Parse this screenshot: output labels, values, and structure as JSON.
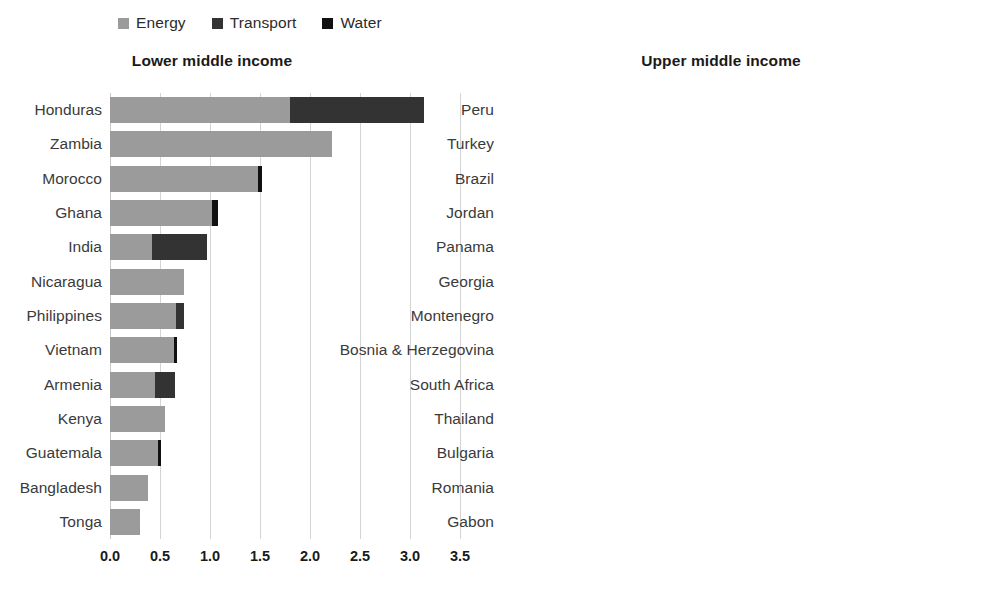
{
  "legend": {
    "items": [
      {
        "label": "Energy",
        "color": "#9b9b9b",
        "name": "energy"
      },
      {
        "label": "Transport",
        "color": "#333333",
        "name": "transport"
      },
      {
        "label": "Water",
        "color": "#111111",
        "name": "water"
      }
    ]
  },
  "chart_data": [
    {
      "type": "bar",
      "orientation": "horizontal",
      "stacked": true,
      "title": "Lower middle income",
      "xlabel": "",
      "ylabel": "",
      "xlim": [
        0.0,
        3.5
      ],
      "xticks": [
        "0.0",
        "0.5",
        "1.0",
        "1.5",
        "2.0",
        "2.5",
        "3.0",
        "3.5"
      ],
      "xtick_values": [
        0.0,
        0.5,
        1.0,
        1.5,
        2.0,
        2.5,
        3.0,
        3.5
      ],
      "grid": true,
      "legend_position": "top-left",
      "categories": [
        "Honduras",
        "Zambia",
        "Morocco",
        "Ghana",
        "India",
        "Nicaragua",
        "Philippines",
        "Vietnam",
        "Armenia",
        "Kenya",
        "Guatemala",
        "Bangladesh",
        "Tonga"
      ],
      "series": [
        {
          "name": "Energy",
          "color": "#9b9b9b",
          "values": [
            1.8,
            2.22,
            1.48,
            1.02,
            0.42,
            0.74,
            0.66,
            0.64,
            0.45,
            0.55,
            0.48,
            0.38,
            0.3
          ]
        },
        {
          "name": "Transport",
          "color": "#333333",
          "values": [
            1.34,
            0.0,
            0.0,
            0.0,
            0.55,
            0.0,
            0.08,
            0.0,
            0.2,
            0.0,
            0.0,
            0.0,
            0.0
          ]
        },
        {
          "name": "Water",
          "color": "#111111",
          "values": [
            0.0,
            0.0,
            0.04,
            0.06,
            0.0,
            0.0,
            0.0,
            0.03,
            0.0,
            0.0,
            0.03,
            0.0,
            0.0
          ]
        }
      ],
      "totals": [
        3.14,
        2.22,
        1.52,
        1.08,
        0.97,
        0.74,
        0.74,
        0.67,
        0.65,
        0.55,
        0.51,
        0.38,
        0.3
      ]
    },
    {
      "type": "bar",
      "orientation": "horizontal",
      "stacked": true,
      "title": "Upper middle income",
      "xlabel": "",
      "ylabel": "",
      "xlim": [
        0.0,
        3.0
      ],
      "xticks": [
        "0.0",
        "0.5",
        "1.0",
        "1.5",
        "2.0",
        "2.5",
        "3.0"
      ],
      "xtick_values": [
        0.0,
        0.5,
        1.0,
        1.5,
        2.0,
        2.5,
        3.0
      ],
      "grid": true,
      "legend_position": "top-left",
      "categories": [
        "Peru",
        "Turkey",
        "Brazil",
        "Jordan",
        "Panama",
        "Georgia",
        "Montenegro",
        "Bosnia & Herzegovina",
        "South Africa",
        "Thailand",
        "Bulgaria",
        "Romania",
        "Gabon"
      ],
      "series": [
        {
          "name": "Energy",
          "color": "#9b9b9b",
          "values": [
            0.85,
            0.52,
            0.9,
            1.22,
            0.62,
            0.92,
            0.78,
            0.78,
            0.72,
            0.53,
            0.47,
            0.42,
            0.42
          ]
        },
        {
          "name": "Transport",
          "color": "#333333",
          "values": [
            1.6,
            1.95,
            0.8,
            0.09,
            0.33,
            0.0,
            0.0,
            0.0,
            0.0,
            0.0,
            0.0,
            0.0,
            0.0
          ]
        },
        {
          "name": "Water",
          "color": "#111111",
          "values": [
            0.07,
            0.0,
            0.08,
            0.11,
            0.0,
            0.0,
            0.0,
            0.0,
            0.0,
            0.0,
            0.03,
            0.0,
            0.0
          ]
        }
      ],
      "totals": [
        2.52,
        2.47,
        1.78,
        1.42,
        0.95,
        0.92,
        0.78,
        0.78,
        0.72,
        0.53,
        0.5,
        0.42,
        0.42
      ]
    }
  ]
}
